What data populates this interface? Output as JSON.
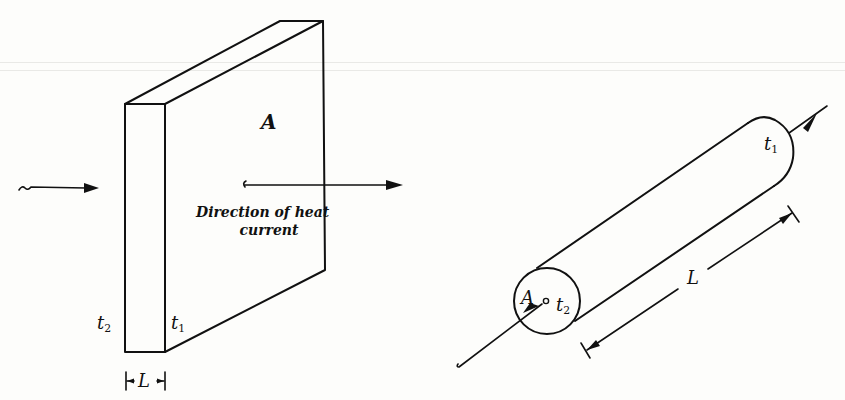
{
  "figure": {
    "slab": {
      "face_label": "A",
      "left_temp": {
        "base": "t",
        "sub": "2"
      },
      "right_temp": {
        "base": "t",
        "sub": "1"
      },
      "thickness_label": "L",
      "direction_caption_line1": "Direction of heat",
      "direction_caption_line2": "current"
    },
    "cylinder": {
      "area_label": "A",
      "near_temp": {
        "base": "t",
        "sub": "2"
      },
      "far_temp": {
        "base": "t",
        "sub": "1"
      },
      "length_label": "L"
    },
    "colors": {
      "ink": "#111111",
      "paper": "#fdfdfb"
    }
  }
}
